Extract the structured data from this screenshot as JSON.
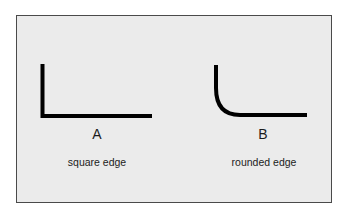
{
  "diagram": {
    "panels": [
      {
        "letter": "A",
        "caption": "square edge",
        "shape": "square-corner"
      },
      {
        "letter": "B",
        "caption": "rounded edge",
        "shape": "rounded-corner"
      }
    ],
    "colors": {
      "background": "#ebebeb",
      "stroke": "#000000",
      "border": "#4a4a4a",
      "text": "#1c1c1c"
    }
  }
}
